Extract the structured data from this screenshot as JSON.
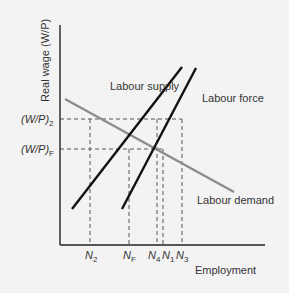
{
  "diagram": {
    "type": "labour-market",
    "y_axis_label": "Real wage (W/P)",
    "x_axis_label": "Employment",
    "y_ticks": [
      {
        "base": "(W/P)",
        "sub": "2",
        "y": 119
      },
      {
        "base": "(W/P)",
        "sub": "F",
        "y": 149
      }
    ],
    "x_ticks": [
      {
        "base": "N",
        "sub": "2",
        "x": 90
      },
      {
        "base": "N",
        "sub": "F",
        "x": 129
      },
      {
        "base": "N",
        "sub": "4",
        "x": 157
      },
      {
        "base": "N",
        "sub": "1",
        "x": 163
      },
      {
        "base": "N",
        "sub": "3",
        "x": 182
      }
    ],
    "curves": [
      {
        "name": "Labour supply",
        "color": "#111111"
      },
      {
        "name": "Labour force",
        "color": "#111111"
      },
      {
        "name": "Labour demand",
        "color": "#8c8c8c"
      }
    ],
    "colors": {
      "background": "#f3f3f3",
      "axis": "#222222",
      "dashed": "#555555"
    }
  }
}
